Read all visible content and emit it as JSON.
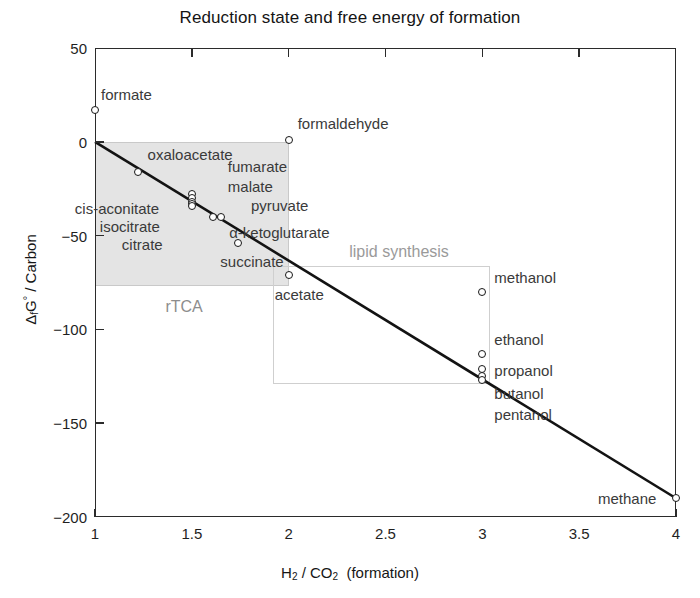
{
  "chart_data": {
    "type": "scatter",
    "title": "Reduction state and free energy of formation",
    "xlabel": "H2 / CO2  (formation)",
    "ylabel": "ΔfG° / Carbon",
    "xlim": [
      1,
      4
    ],
    "ylim": [
      -200,
      50
    ],
    "xticks": [
      "1",
      "1.5",
      "2",
      "2.5",
      "3",
      "3.5",
      "4"
    ],
    "xtick_values": [
      1,
      1.5,
      2,
      2.5,
      3,
      3.5,
      4
    ],
    "yticks": [
      "50",
      "0",
      "-50",
      "-100",
      "-150",
      "-200"
    ],
    "ytick_values": [
      50,
      0,
      -50,
      -100,
      -150,
      -200
    ],
    "grid": false,
    "legend": "none",
    "points": [
      {
        "label": "formate",
        "x": 1.0,
        "y": 17,
        "label_dx": 6,
        "label_dy": -16
      },
      {
        "label": "formaldehyde",
        "x": 2.0,
        "y": 1,
        "label_dx": 9,
        "label_dy": -17
      },
      {
        "label": "oxaloacetate",
        "x": 1.22,
        "y": -16,
        "label_dx": 10,
        "label_dy": -18
      },
      {
        "label": "fumarate",
        "x": 1.5,
        "y": -28,
        "label_dx": 36,
        "label_dy": -28
      },
      {
        "label": "malate",
        "x": 1.5,
        "y": -30,
        "label_dx": 36,
        "label_dy": -12
      },
      {
        "label": "cis-aconitate",
        "x": 1.5,
        "y": -32,
        "label_dx": -117,
        "label_dy": 6
      },
      {
        "label": "isocitrate",
        "x": 1.5,
        "y": -33,
        "label_dx": -92,
        "label_dy": 22
      },
      {
        "label": "citrate",
        "x": 1.5,
        "y": -34,
        "label_dx": -70,
        "label_dy": 38
      },
      {
        "label": "pyruvate",
        "x": 1.65,
        "y": -40,
        "label_dx": 30,
        "label_dy": -12
      },
      {
        "label": "α-ketoglutarate",
        "x": 1.61,
        "y": -40,
        "label_dx": 16,
        "label_dy": 15
      },
      {
        "label": "succinate",
        "x": 1.74,
        "y": -54,
        "label_dx": -18,
        "label_dy": 18
      },
      {
        "label": "acetate",
        "x": 2.0,
        "y": -71,
        "label_dx": -14,
        "label_dy": 19
      },
      {
        "label": "methanol",
        "x": 3.0,
        "y": -80,
        "label_dx": 12,
        "label_dy": -15
      },
      {
        "label": "ethanol",
        "x": 3.0,
        "y": -113,
        "label_dx": 12,
        "label_dy": -15
      },
      {
        "label": "propanol",
        "x": 3.0,
        "y": -121,
        "label_dx": 12,
        "label_dy": 1
      },
      {
        "label": "butanol",
        "x": 3.0,
        "y": -125,
        "label_dx": 12,
        "label_dy": 17
      },
      {
        "label": "pentanol",
        "x": 3.0,
        "y": -127,
        "label_dx": 12,
        "label_dy": 34
      },
      {
        "label": "methane",
        "x": 4.0,
        "y": -190,
        "label_dx": -78,
        "label_dy": 0
      }
    ],
    "trend_line": {
      "x0": 1.0,
      "y0": 0,
      "x1": 4.0,
      "y1": -190
    },
    "regions": [
      {
        "name": "rTCA",
        "x0": 1.0,
        "y0": 0,
        "x1": 2.0,
        "y1": -77,
        "fill": "#e4e4e4",
        "stroke": "#c9c9c9",
        "label": "rTCA",
        "label_x": 1.46,
        "label_y": -88
      },
      {
        "name": "lipid synthesis",
        "x0": 1.92,
        "y0": -66,
        "x1": 3.04,
        "y1": -129,
        "fill": "none",
        "stroke": "#cfcfcf",
        "label": "lipid synthesis",
        "label_x": 2.57,
        "label_y": -59
      }
    ]
  },
  "colors": {
    "axis": "#2b2b2b",
    "marker_edge": "#171717",
    "marker_fill": "#ffffff",
    "trend": "#131313",
    "region_fill": "#e4e4e4",
    "region_stroke": "#c9c9c9",
    "label_text": "#3a3a3a",
    "region_label": "#9a9a9a",
    "background": "#ffffff"
  }
}
